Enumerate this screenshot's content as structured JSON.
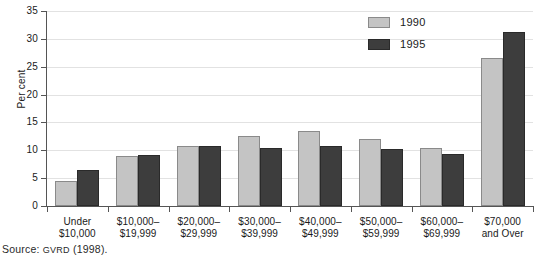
{
  "chart_data": {
    "type": "bar",
    "title": "",
    "xlabel": "",
    "ylabel": "Per cent",
    "ylim": [
      0,
      35
    ],
    "ytick_step": 5,
    "yticks": [
      0,
      5,
      10,
      15,
      20,
      25,
      30,
      35
    ],
    "grid": true,
    "legend_position": "top-right",
    "categories": [
      "Under\n$10,000",
      "$10,000–\n$19,999",
      "$20,000–\n$29,999",
      "$30,000–\n$39,999",
      "$40,000–\n$49,999",
      "$50,000–\n$59,999",
      "$60,000–\n$69,999",
      "$70,000\nand Over"
    ],
    "series": [
      {
        "name": "1990",
        "color": "#c4c4c4",
        "values": [
          4.5,
          9.0,
          10.8,
          12.6,
          13.4,
          12.1,
          10.5,
          26.6
        ]
      },
      {
        "name": "1995",
        "color": "#3d3d3d",
        "values": [
          6.4,
          9.2,
          10.8,
          10.4,
          10.8,
          10.2,
          9.4,
          31.2
        ]
      }
    ]
  },
  "legend": {
    "items": [
      {
        "label": "1990"
      },
      {
        "label": "1995"
      }
    ]
  },
  "axis": {
    "y_label": "Per cent",
    "y_tick_labels": [
      "35",
      "30",
      "25",
      "20",
      "15",
      "10",
      "5",
      "0"
    ]
  },
  "source": {
    "prefix": "Source: ",
    "agency": "GVRD",
    "suffix": " (1998)."
  }
}
